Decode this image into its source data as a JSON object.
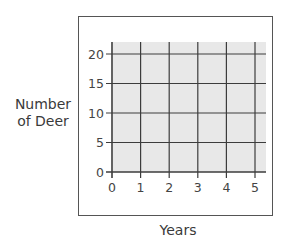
{
  "chart_data": {
    "type": "line",
    "title": "",
    "xlabel": "Years",
    "ylabel": "Number of Deer",
    "ylabel_lines": [
      "Number",
      "of Deer"
    ],
    "x_ticks": [
      0,
      1,
      2,
      3,
      4,
      5
    ],
    "y_ticks": [
      0,
      5,
      10,
      15,
      20
    ],
    "xlim": [
      0,
      5.4
    ],
    "ylim": [
      0,
      22
    ],
    "grid": true,
    "series": [],
    "legend": null
  },
  "colors": {
    "plot_background": "#e8e8e8",
    "grid_line": "#3c3c3c",
    "frame": "#555555",
    "text": "#3a3a3a"
  }
}
